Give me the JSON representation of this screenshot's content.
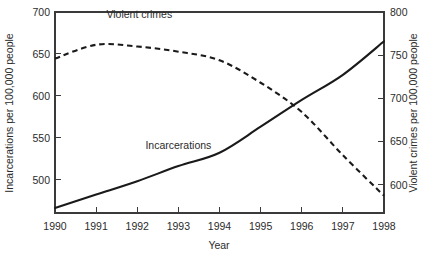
{
  "chart_data": {
    "type": "line",
    "title": "",
    "xlabel": "Year",
    "ylabel": "Incarcerations per 100,000 people",
    "y2label": "Violent crimes per 100,000 people",
    "grid": false,
    "legend_position": "inline-annotations",
    "x": [
      1990,
      1991,
      1992,
      1993,
      1994,
      1995,
      1996,
      1997,
      1998
    ],
    "xticklabels": [
      "1990",
      "1991",
      "1992",
      "1993",
      "1994",
      "1995",
      "1996",
      "1997",
      "1998"
    ],
    "xlim": [
      1990,
      1998
    ],
    "ylim": [
      460,
      700
    ],
    "yticks": [
      500,
      550,
      600,
      650,
      700
    ],
    "yticklabels": [
      "500",
      "550",
      "600",
      "650",
      "700"
    ],
    "y2lim": [
      567,
      800
    ],
    "y2ticks": [
      600,
      650,
      700,
      750,
      800
    ],
    "y2ticklabels": [
      "600",
      "650",
      "700",
      "750",
      "800"
    ],
    "series": [
      {
        "name": "Incarcerations",
        "axis": "left",
        "style": "solid",
        "label_text": "Incarcerations",
        "label_x": 1993,
        "label_y": 537,
        "values": [
          466,
          482,
          498,
          516,
          532,
          563,
          595,
          625,
          665
        ]
      },
      {
        "name": "Violent crimes",
        "axis": "right",
        "style": "dashed",
        "label_text": "Violent crimes",
        "label_x": 1992.05,
        "label_y": 793,
        "values": [
          746,
          762,
          760,
          754,
          744,
          718,
          684,
          634,
          587
        ]
      }
    ]
  },
  "geometry": {
    "plot": {
      "left": 55,
      "right": 384,
      "top": 12,
      "bottom": 213
    }
  }
}
